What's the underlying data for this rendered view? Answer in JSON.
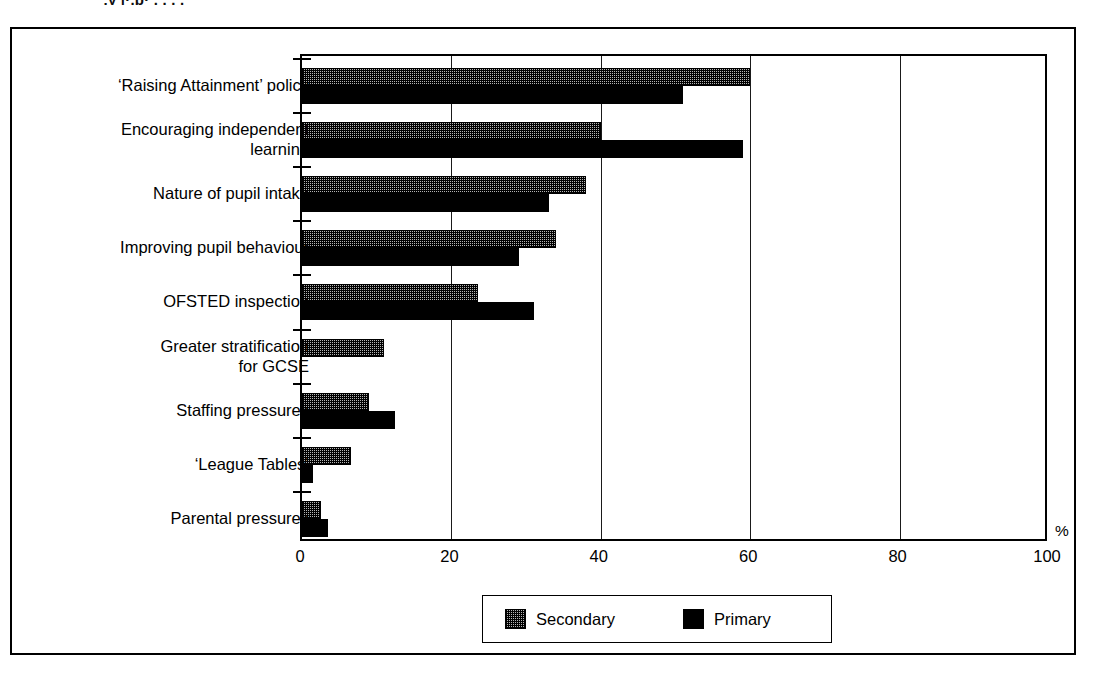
{
  "title_remnant": "''‚y   |·.p· . . . .",
  "chart_data": {
    "type": "bar",
    "orientation": "horizontal",
    "title": "",
    "xlabel": "%",
    "ylabel": "",
    "xlim": [
      0,
      100
    ],
    "xticks": [
      0,
      20,
      40,
      60,
      80,
      100
    ],
    "xtick_labels": [
      "0",
      "20",
      "40",
      "60",
      "80",
      "100"
    ],
    "grid": "vertical",
    "legend_position": "bottom-center",
    "categories": [
      "‘Raising Attainment’ policy",
      "Encouraging independent\nlearning",
      "Nature of pupil intake",
      "Improving pupil behaviour",
      "OFSTED inspection",
      "Greater stratification\nfor GCSE",
      "Staffing pressures",
      "‘League Tables’",
      "Parental  pressures"
    ],
    "series": [
      {
        "name": "Secondary",
        "fill": "checkered",
        "color": "#b4b4b4",
        "values": [
          60,
          40,
          38,
          34,
          23.5,
          11,
          9,
          6.5,
          2.5
        ]
      },
      {
        "name": "Primary",
        "fill": "solid",
        "color": "#000000",
        "values": [
          51,
          59,
          33,
          29,
          31,
          0,
          12.5,
          1.5,
          3.5
        ]
      }
    ]
  },
  "legend": {
    "entries": [
      {
        "label": "Secondary",
        "swatch": "checkered-swatch"
      },
      {
        "label": "Primary",
        "swatch": "solid-black-swatch"
      }
    ]
  },
  "axis": {
    "percent_symbol": "%"
  }
}
